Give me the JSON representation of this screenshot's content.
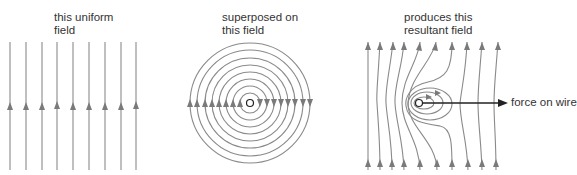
{
  "panels": [
    {
      "id": "uniform",
      "caption": "this uniform\nfield"
    },
    {
      "id": "circular",
      "caption": "superposed on\nthis field"
    },
    {
      "id": "resultant",
      "caption": "produces this\nresultant field"
    }
  ],
  "force_label": "force on wire",
  "colors": {
    "field_line": "#8a8a8a",
    "arrowhead": "#7a7a7a",
    "wire": "#222222",
    "force_arrow": "#222222",
    "text": "#333333"
  },
  "uniform_field": {
    "line_x": [
      10,
      26,
      42,
      57,
      73,
      89,
      105,
      121,
      136
    ],
    "y_top": 42,
    "y_bottom": 170,
    "arrow_y": 107,
    "direction": "up"
  },
  "circular_field": {
    "center": [
      250,
      103
    ],
    "radii": [
      10,
      17,
      24,
      31,
      38,
      45,
      53,
      60
    ],
    "left_side_arrows": "up",
    "right_side_arrows": "down"
  },
  "resultant_field": {
    "wire_center": [
      419,
      103
    ],
    "force_arrow_end_x": 507
  }
}
